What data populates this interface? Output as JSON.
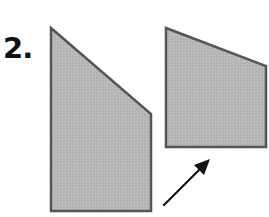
{
  "problem": {
    "number_label": "2."
  },
  "figure": {
    "colors": {
      "fill": "#b8b8b8",
      "stroke": "#555555",
      "arrow": "#111111",
      "background": "#ffffff"
    },
    "shapes": [
      {
        "name": "left-pentagon",
        "points": "51,28 151,114 151,211 51,211"
      },
      {
        "name": "right-quadrilateral",
        "points": "166,28 266,66 266,147 166,147"
      }
    ],
    "arrow": {
      "x1": 164,
      "y1": 205,
      "x2": 210,
      "y2": 159
    }
  }
}
